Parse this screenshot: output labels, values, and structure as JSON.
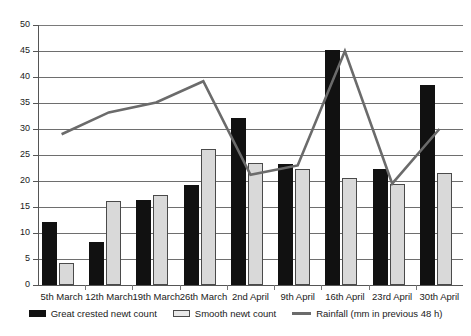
{
  "chart_data": {
    "type": "bar",
    "title": "",
    "subtitle": "",
    "xlabel": "",
    "ylabel": "",
    "ylim": [
      0,
      50
    ],
    "ytick_step": 5,
    "yticks": [
      "0",
      "5",
      "10",
      "15",
      "20",
      "25",
      "30",
      "35",
      "40",
      "45",
      "50"
    ],
    "grid": true,
    "legend_position": "bottom",
    "categories": [
      "5th March",
      "12th March",
      "19th March",
      "26th March",
      "2nd April",
      "9th April",
      "16th April",
      "23rd April",
      "30th April"
    ],
    "series": [
      {
        "name": "Great crested newt count",
        "type": "bar",
        "color": "#111111",
        "values": [
          12.1,
          8.2,
          16.3,
          19.3,
          32.2,
          23.2,
          45.1,
          22.3,
          38.5
        ]
      },
      {
        "name": "Smooth newt count",
        "type": "bar",
        "color": "#d9d9d9",
        "values": [
          4.2,
          16.2,
          17.3,
          26.1,
          23.4,
          22.3,
          20.5,
          19.4,
          21.5
        ]
      },
      {
        "name": "Rainfall (mm in previous 48 h)",
        "type": "line",
        "color": "#6b6b6b",
        "values": [
          29.0,
          33.2,
          35.1,
          39.2,
          21.2,
          23.0,
          45.0,
          19.5,
          30.0
        ]
      }
    ]
  },
  "legend": {
    "items": [
      {
        "label": "Great crested newt count",
        "marker": "dark-square-swatch"
      },
      {
        "label": "Smooth newt count",
        "marker": "light-square-swatch"
      },
      {
        "label": "Rainfall (mm in previous 48 h)",
        "marker": "line-swatch"
      }
    ]
  },
  "colors": {
    "bar_dark": "#111111",
    "bar_light": "#d9d9d9",
    "line": "#6b6b6b",
    "grid": "#6e6e6e",
    "axis": "#555555",
    "background": "#ffffff",
    "text": "#1a1a1a"
  }
}
